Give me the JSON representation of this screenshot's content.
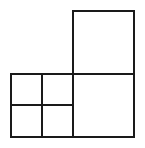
{
  "diagram": {
    "stroke_color": "#1a1a1a",
    "background": "#ffffff",
    "shapes": [
      {
        "id": "top-square",
        "x": 73,
        "y": 11,
        "w": 61,
        "h": 63
      },
      {
        "id": "bottom-right-square",
        "x": 73,
        "y": 74,
        "w": 61,
        "h": 63
      },
      {
        "id": "bottom-left-square",
        "x": 11,
        "y": 74,
        "w": 62,
        "h": 63
      }
    ],
    "subdivision": {
      "vertical_x": 42,
      "horizontal_y": 105,
      "horizontal_end_x": 71
    }
  }
}
